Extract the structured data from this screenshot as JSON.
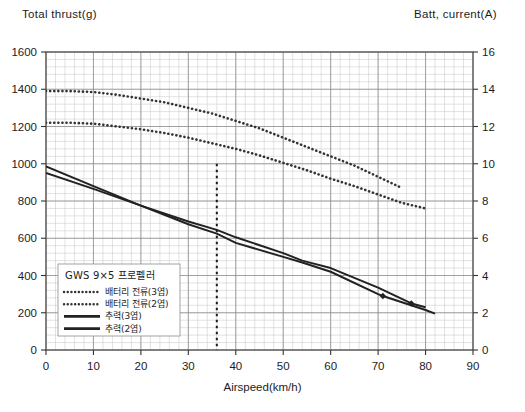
{
  "titles": {
    "left_axis": "Total  thrust(g)",
    "right_axis": "Batt,  current(A)",
    "x_axis": "Airspeed(km/h)"
  },
  "legend": {
    "heading": "GWS 9×5 프로펠러",
    "items": [
      {
        "label": "배터리 전류(3엽)",
        "style": "dotted",
        "color": "#333333"
      },
      {
        "label": "배터리 전류(2엽)",
        "style": "dotted",
        "color": "#333333"
      },
      {
        "label": "추력(3엽)",
        "style": "solid",
        "color": "#222222"
      },
      {
        "label": "추력(2엽)",
        "style": "solid",
        "color": "#222222"
      }
    ]
  },
  "axis_labels": {
    "left": [
      "0",
      "200",
      "400",
      "600",
      "800",
      "1000",
      "1200",
      "1400",
      "1600"
    ],
    "right": [
      "0",
      "2",
      "4",
      "6",
      "8",
      "10",
      "12",
      "14",
      "16"
    ],
    "bottom": [
      "0",
      "10",
      "20",
      "30",
      "40",
      "50",
      "60",
      "70",
      "80",
      "90"
    ]
  },
  "chart_data": {
    "type": "line",
    "title": "",
    "xlabel": "Airspeed(km/h)",
    "ylabel": "Total  thrust(g)",
    "y2label": "Batt,  current(A)",
    "xlim": [
      0,
      90
    ],
    "ylim": [
      0,
      1600
    ],
    "y2lim": [
      0,
      16
    ],
    "grid": true,
    "legend_position": "inside-lower-left",
    "annotations": [
      {
        "type": "vertical-dashed-line",
        "x": 36,
        "y_from": 0,
        "y_to": 1000
      }
    ],
    "series": [
      {
        "name": "배터리 전류(3엽)",
        "axis": "right",
        "style": "dotted",
        "color": "#333333",
        "x": [
          0,
          5,
          10,
          15,
          20,
          25,
          30,
          35,
          40,
          45,
          50,
          55,
          60,
          65,
          70,
          75
        ],
        "values": [
          13.9,
          13.9,
          13.85,
          13.7,
          13.5,
          13.3,
          13.0,
          12.7,
          12.3,
          11.9,
          11.4,
          10.9,
          10.4,
          9.9,
          9.3,
          8.7
        ]
      },
      {
        "name": "배터리 전류(2엽)",
        "axis": "right",
        "style": "dotted",
        "color": "#333333",
        "x": [
          0,
          5,
          10,
          15,
          20,
          25,
          30,
          35,
          40,
          45,
          50,
          55,
          60,
          65,
          70,
          75,
          80
        ],
        "values": [
          12.2,
          12.2,
          12.15,
          12.0,
          11.85,
          11.65,
          11.4,
          11.1,
          10.8,
          10.45,
          10.05,
          9.65,
          9.2,
          8.8,
          8.35,
          7.9,
          7.6
        ]
      },
      {
        "name": "추력(3엽)",
        "axis": "left",
        "style": "solid",
        "color": "#222222",
        "marker_at": {
          "x": 71,
          "y": 290
        },
        "x": [
          0,
          10,
          20,
          30,
          36,
          40,
          50,
          54,
          60,
          70,
          71,
          80,
          82
        ],
        "values": [
          985,
          880,
          775,
          675,
          625,
          575,
          500,
          470,
          420,
          300,
          290,
          215,
          195
        ]
      },
      {
        "name": "추력(2엽)",
        "axis": "left",
        "style": "solid",
        "color": "#222222",
        "marker_at": {
          "x": 77,
          "y": 250
        },
        "x": [
          0,
          10,
          20,
          30,
          36,
          40,
          50,
          54,
          60,
          70,
          77,
          80
        ],
        "values": [
          950,
          865,
          775,
          690,
          645,
          605,
          520,
          480,
          440,
          335,
          250,
          230
        ]
      }
    ]
  }
}
